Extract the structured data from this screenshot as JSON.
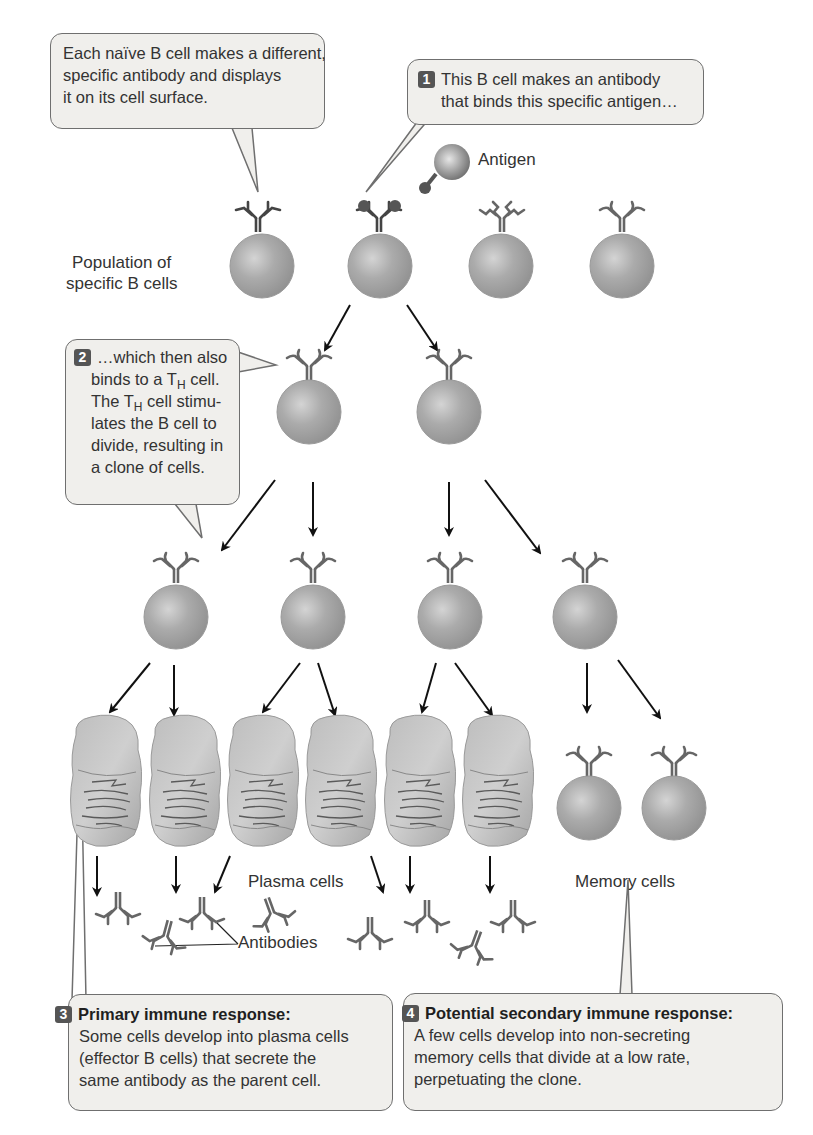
{
  "callouts": {
    "naive": {
      "lines": [
        "Each naïve B cell makes a different,",
        "specific antibody and displays",
        "it on its cell surface."
      ]
    },
    "step1": {
      "badge": "1",
      "lines": [
        "This B cell makes an antibody",
        "that binds this specific antigen…"
      ]
    },
    "step2": {
      "badge": "2",
      "line1": "…which then also",
      "line2_pre": "binds to a T",
      "line2_sub": "H",
      "line2_post": " cell.",
      "line3_pre": "The T",
      "line3_sub": "H",
      "line3_post": " cell stimu-",
      "line4": "lates the B cell to",
      "line5": "divide, resulting in",
      "line6": "a clone of cells."
    },
    "step3": {
      "badge": "3",
      "title": "Primary immune response:",
      "lines": [
        "Some cells develop into plasma cells",
        "(effector B cells) that secrete the",
        "same antibody as the parent cell."
      ]
    },
    "step4": {
      "badge": "4",
      "title": "Potential secondary immune response:",
      "lines": [
        "A few cells develop into non-secreting",
        "memory cells that divide at a low rate,",
        "perpetuating the clone."
      ]
    }
  },
  "labels": {
    "antigen": "Antigen",
    "population_line1": "Population of",
    "population_line2": "specific B cells",
    "plasma_cells": "Plasma cells",
    "memory_cells": "Memory cells",
    "antibodies": "Antibodies"
  },
  "colors": {
    "cell": "#a8a8a8",
    "antibody": "#666666",
    "bubble_bg": "#f0efec",
    "badge": "#555555"
  }
}
